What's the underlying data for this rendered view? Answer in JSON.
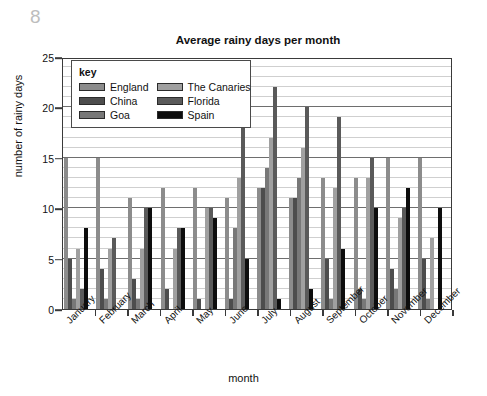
{
  "page_number": "8",
  "chart_data": {
    "type": "bar",
    "title": "Average rainy days per month",
    "xlabel": "month",
    "ylabel": "number of rainy days",
    "ylim": [
      0,
      25
    ],
    "yticks": [
      0,
      5,
      10,
      15,
      20,
      25
    ],
    "minor_gridlines": true,
    "legend_position": "inside-top-left",
    "legend_title": "key",
    "categories": [
      "January",
      "February",
      "March",
      "April",
      "May",
      "June",
      "July",
      "August",
      "September",
      "October",
      "November",
      "December"
    ],
    "series": [
      {
        "name": "England",
        "color": "#8c8c8c",
        "values": [
          15,
          15,
          11,
          12,
          12,
          11,
          12,
          11,
          13,
          13,
          15,
          15
        ]
      },
      {
        "name": "China",
        "color": "#4d4d4d",
        "values": [
          5,
          4,
          3,
          2,
          1,
          1,
          12,
          11,
          5,
          2,
          4,
          5
        ]
      },
      {
        "name": "Goa",
        "color": "#787878",
        "values": [
          1,
          1,
          1,
          0,
          0,
          8,
          14,
          13,
          1,
          1,
          2,
          1
        ]
      },
      {
        "name": "The Canaries",
        "color": "#a0a0a0",
        "values": [
          6,
          6,
          6,
          6,
          10,
          13,
          17,
          16,
          12,
          13,
          9,
          7
        ]
      },
      {
        "name": "Florida",
        "color": "#5a5a5a",
        "values": [
          2,
          7,
          10,
          8,
          10,
          20,
          22,
          20,
          19,
          15,
          10,
          0
        ]
      },
      {
        "name": "Spain",
        "color": "#0d0d0d",
        "values": [
          8,
          0,
          10,
          8,
          9,
          5,
          1,
          2,
          6,
          10,
          12,
          10
        ]
      }
    ]
  }
}
